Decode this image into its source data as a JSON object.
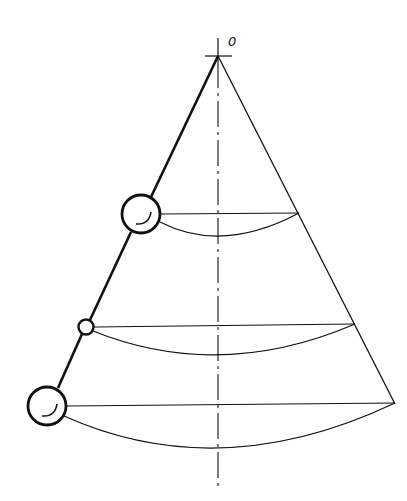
{
  "figure": {
    "origin_label": "0",
    "colors": {
      "line": "#111111",
      "background": "#ffffff"
    },
    "apex": {
      "x": 218,
      "y": 56
    },
    "axis": {
      "x": 218,
      "y_top": 38,
      "y_bottom": 488,
      "style": "dash-dot"
    },
    "levels": [
      {
        "y": 214,
        "left": {
          "x": 141
        },
        "right": {
          "x": 299
        },
        "arc_bottom_y": 236,
        "ball_radius": 20,
        "ball_center": {
          "x": 141,
          "y": 214
        }
      },
      {
        "y": 325,
        "left": {
          "x": 86
        },
        "right": {
          "x": 355
        },
        "arc_bottom_y": 357,
        "ball_radius": 8,
        "ball_center": {
          "x": 86,
          "y": 327
        }
      },
      {
        "y": 404,
        "left": {
          "x": 47
        },
        "right": {
          "x": 395
        },
        "arc_bottom_y": 448,
        "ball_radius": 20,
        "ball_center": {
          "x": 47,
          "y": 406
        }
      }
    ]
  }
}
